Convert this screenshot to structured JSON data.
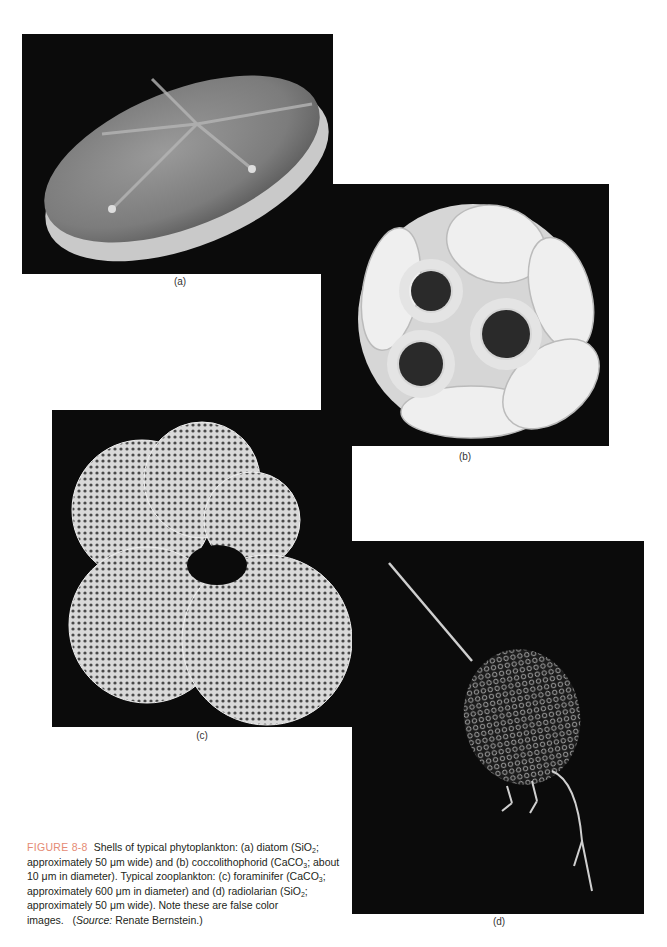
{
  "figure": {
    "number": "FIGURE 8-8",
    "caption_parts": {
      "p1": "Shells of typical phytoplankton: (a) diatom (SiO",
      "s1": "2",
      "p2": "; approximately 50 μm wide) and (b) coccolithophorid (CaCO",
      "s2": "3",
      "p3": "; about 10 μm in diameter). Typical zooplankton: (c) foraminifer (CaCO",
      "s3": "3",
      "p4": "; approximately 600 μm in diameter) and (d) radiolarian (SiO",
      "s4": "2",
      "p5": "; approximately 50 μm wide). Note these are false color images.",
      "source_open": "(",
      "source_label": "Source:",
      "source_text": " Renate Bernstein.)"
    },
    "accent_color": "#e58a74"
  },
  "panels": [
    {
      "id": "a",
      "label": "(a)",
      "subject": "diatom"
    },
    {
      "id": "b",
      "label": "(b)",
      "subject": "coccolithophorid"
    },
    {
      "id": "c",
      "label": "(c)",
      "subject": "foraminifer"
    },
    {
      "id": "d",
      "label": "(d)",
      "subject": "radiolarian"
    }
  ]
}
